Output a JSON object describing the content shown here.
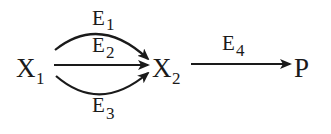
{
  "diagram": {
    "type": "reaction-pathway",
    "colors": {
      "ink": "#1a1a1a",
      "background": "#ffffff"
    },
    "nodes": [
      {
        "id": "X1",
        "base": "X",
        "sub": "1"
      },
      {
        "id": "X2",
        "base": "X",
        "sub": "2"
      },
      {
        "id": "P",
        "base": "P",
        "sub": ""
      }
    ],
    "edges": [
      {
        "from": "X1",
        "to": "X2",
        "shape": "arc-up",
        "label": {
          "base": "E",
          "sub": "1"
        }
      },
      {
        "from": "X1",
        "to": "X2",
        "shape": "straight",
        "label": {
          "base": "E",
          "sub": "2"
        }
      },
      {
        "from": "X1",
        "to": "X2",
        "shape": "arc-down",
        "label": {
          "base": "E",
          "sub": "3"
        }
      },
      {
        "from": "X2",
        "to": "P",
        "shape": "straight",
        "label": {
          "base": "E",
          "sub": "4"
        }
      }
    ]
  }
}
